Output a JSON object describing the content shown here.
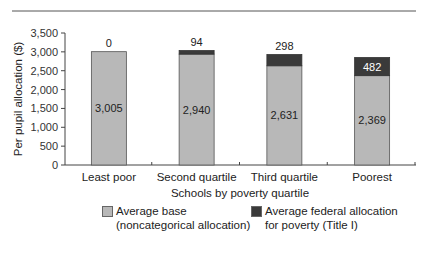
{
  "chart_data": {
    "type": "bar",
    "stacked": true,
    "title": "",
    "xlabel": "Schools by poverty quartile",
    "ylabel": "Per pupil allocation ($)",
    "ylim": [
      0,
      3500
    ],
    "yticks": [
      0,
      500,
      1000,
      1500,
      2000,
      2500,
      3000,
      3500
    ],
    "ytick_labels": [
      "0",
      "500",
      "1,000",
      "1,500",
      "2,000",
      "2,500",
      "3,000",
      "3,500"
    ],
    "categories": [
      "Least poor",
      "Second quartile",
      "Third quartile",
      "Poorest"
    ],
    "series": [
      {
        "name": "Average base (noncategorical allocation)",
        "values": [
          3005,
          2940,
          2631,
          2369
        ],
        "labels": [
          "3,005",
          "2,940",
          "2,631",
          "2,369"
        ],
        "color": "#b8b8b8"
      },
      {
        "name": "Average federal allocation for poverty (Title I)",
        "values": [
          0,
          94,
          298,
          482
        ],
        "labels": [
          "0",
          "94",
          "298",
          "482"
        ],
        "color": "#3a3a3a"
      }
    ],
    "legend": {
      "position": "bottom",
      "items": [
        {
          "line1": "Average base",
          "line2": "(noncategorical allocation)",
          "color": "#b8b8b8"
        },
        {
          "line1": "Average federal allocation",
          "line2": "for poverty (Title I)",
          "color": "#3a3a3a"
        }
      ]
    },
    "grid": false
  }
}
